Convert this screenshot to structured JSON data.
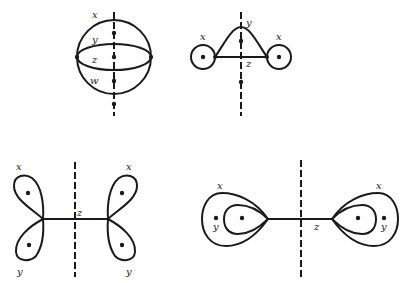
{
  "figures": [
    {
      "id": "sphere",
      "labels": {
        "x": "x",
        "y": "y",
        "z": "z",
        "w": "w"
      }
    },
    {
      "id": "bent-bond",
      "labels": {
        "x_left": "x",
        "x_right": "x",
        "y": "y",
        "z": "z"
      }
    },
    {
      "id": "four-lobes",
      "labels": {
        "x_left": "x",
        "x_right": "x",
        "y_left": "y",
        "y_right": "y",
        "z": "z"
      }
    },
    {
      "id": "nested-lobes",
      "labels": {
        "x_left": "x",
        "x_right": "x",
        "y_left": "y",
        "y_right": "y",
        "z": "z"
      }
    }
  ]
}
